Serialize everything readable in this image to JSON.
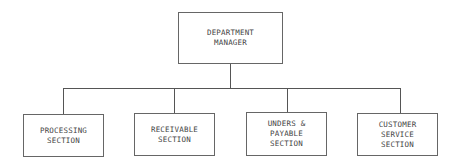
{
  "chart": {
    "root": {
      "label": "DEPARTMENT\nMANAGER"
    },
    "children": [
      {
        "label": "PROCESSING\nSECTION"
      },
      {
        "label": "RECEIVABLE\nSECTION"
      },
      {
        "label": "UNDERS &\nPAYABLE\nSECTION"
      },
      {
        "label": "CUSTOMER\nSERVICE\nSECTION"
      }
    ]
  },
  "colors": {
    "line": "#555555",
    "border": "#666666",
    "text": "#444444",
    "background": "#ffffff"
  }
}
